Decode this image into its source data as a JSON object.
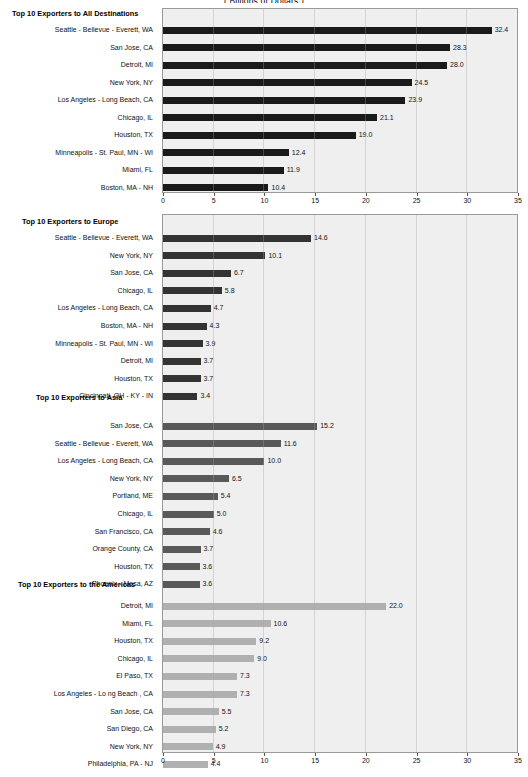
{
  "figure": {
    "suptitle": "(  Billions of Dollars  )",
    "axis_max": 35,
    "axis_ticks": [
      0,
      5,
      10,
      15,
      20,
      25,
      30,
      35
    ],
    "colors": {
      "panel_bg": "#efefef",
      "panel_border": "#9a9a9a",
      "all_destinations_bar": "#1a1a1a",
      "europe_bar": "#333333",
      "asia_bar": "#595959",
      "americas_bar": "#b0b0b0",
      "text": "#111111"
    }
  },
  "chart_data": [
    {
      "type": "bar",
      "orientation": "horizontal",
      "title": "Top 10 Exporters to All Destinations",
      "xlabel": "",
      "ylabel": "",
      "xlim": [
        0,
        35
      ],
      "xticks": [
        0,
        5,
        10,
        15,
        20,
        25,
        30,
        35
      ],
      "grid": true,
      "legend": "none",
      "bar_color": "#1a1a1a",
      "categories": [
        "Seattle - Bellevue - Everett, WA",
        "San Jose, CA",
        "Detroit, MI",
        "New York, NY",
        "Los Angeles - Long Beach, CA",
        "Chicago, IL",
        "Houston, TX",
        "Minneapolis - St. Paul, MN - WI",
        "Miami, FL",
        "Boston, MA - NH"
      ],
      "values": [
        32.4,
        28.3,
        28.0,
        24.5,
        23.9,
        21.1,
        19.0,
        12.4,
        11.9,
        10.4
      ],
      "labels": [
        "32.4",
        "28.3",
        "28.0",
        "24.5",
        "23.9",
        "21.1",
        "19.0",
        "12.4",
        "11.9",
        "10.4"
      ]
    },
    {
      "type": "bar",
      "orientation": "horizontal",
      "title": "Top 10 Exporters to Europe",
      "xlabel": "",
      "ylabel": "",
      "xlim": [
        0,
        35
      ],
      "xticks": [
        0,
        5,
        10,
        15,
        20,
        25,
        30,
        35
      ],
      "grid": true,
      "legend": "none",
      "bar_color": "#333333",
      "categories": [
        "Seattle - Bellevue - Everett, WA",
        "New York, NY",
        "San Jose, CA",
        "Chicago, IL",
        "Los Angeles - Long Beach, CA",
        "Boston, MA - NH",
        "Minneapolis - St. Paul, MN - WI",
        "Detroit, MI",
        "Houston, TX",
        "Cincinnati, OH - KY - IN"
      ],
      "values": [
        14.6,
        10.1,
        6.7,
        5.8,
        4.7,
        4.3,
        3.9,
        3.7,
        3.7,
        3.4
      ],
      "labels": [
        "14.6",
        "10.1",
        "6.7",
        "5.8",
        "4.7",
        "4.3",
        "3.9",
        "3.7",
        "3.7",
        "3.4"
      ]
    },
    {
      "type": "bar",
      "orientation": "horizontal",
      "title": "Top 10 Exporters to Asia",
      "xlabel": "",
      "ylabel": "",
      "xlim": [
        0,
        35
      ],
      "xticks": [
        0,
        5,
        10,
        15,
        20,
        25,
        30,
        35
      ],
      "grid": true,
      "legend": "none",
      "bar_color": "#595959",
      "categories": [
        "San Jose, CA",
        "Seattle - Bellevue - Everett, WA",
        "Los Angeles - Long Beach, CA",
        "New York, NY",
        "Portland, ME",
        "Chicago, IL",
        "San Francisco, CA",
        "Orange County, CA",
        "Houston, TX",
        "Phoenix - Mesa, AZ"
      ],
      "values": [
        15.2,
        11.6,
        10.0,
        6.5,
        5.4,
        5.0,
        4.6,
        3.7,
        3.6,
        3.6
      ],
      "labels": [
        "15.2",
        "11.6",
        "10.0",
        "6.5",
        "5.4",
        "5.0",
        "4.6",
        "3.7",
        "3.6",
        "3.6"
      ]
    },
    {
      "type": "bar",
      "orientation": "horizontal",
      "title": "Top 10 Exporters to the Americas",
      "xlabel": "",
      "ylabel": "",
      "xlim": [
        0,
        35
      ],
      "xticks": [
        0,
        5,
        10,
        15,
        20,
        25,
        30,
        35
      ],
      "grid": true,
      "legend": "none",
      "bar_color": "#b0b0b0",
      "categories": [
        "Detroit, MI",
        "Miami, FL",
        "Houston, TX",
        "Chicago, IL",
        "El Paso, TX",
        "Los Angeles - Lo ng Beach , CA",
        "San Jose, CA",
        "San Diego, CA",
        "New York, NY",
        "Philadelphia, PA - NJ"
      ],
      "values": [
        22.0,
        10.6,
        9.2,
        9.0,
        7.3,
        7.3,
        5.5,
        5.2,
        4.9,
        4.4
      ],
      "labels": [
        "22.0",
        "10.6",
        "9.2",
        "9.0",
        "7.3",
        "7.3",
        "5.5",
        "5.2",
        "4.9",
        "4.4"
      ]
    }
  ]
}
